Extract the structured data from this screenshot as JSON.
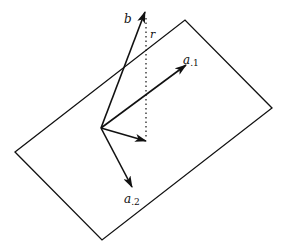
{
  "diagram": {
    "colors": {
      "stroke": "#111111",
      "background": "#ffffff"
    },
    "plane": {
      "vertices": [
        [
          15,
          152
        ],
        [
          185,
          20
        ],
        [
          272,
          108
        ],
        [
          102,
          240
        ]
      ]
    },
    "origin": [
      101,
      128
    ],
    "vectors": [
      {
        "name": "b",
        "to": [
          145,
          12
        ],
        "label": "b",
        "label_pos": [
          124,
          23
        ]
      },
      {
        "name": "a1",
        "to": [
          186,
          65
        ],
        "label": "a",
        "subscript": ".1",
        "label_pos": [
          183,
          64
        ]
      },
      {
        "name": "a2",
        "to": [
          132,
          187
        ],
        "label": "a",
        "subscript": ".2",
        "label_pos": [
          124,
          203
        ]
      },
      {
        "name": "projection",
        "to": [
          146,
          141
        ],
        "label": ""
      }
    ],
    "residual": {
      "from": [
        146,
        16
      ],
      "to": [
        146,
        140
      ],
      "label": "r",
      "label_pos": [
        150,
        37
      ],
      "style": "dotted"
    }
  }
}
